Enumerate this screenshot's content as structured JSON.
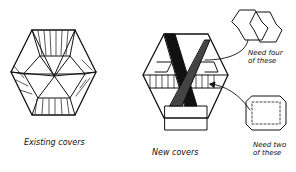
{
  "diagram": {
    "style": "hand-drawn sketch",
    "colors": {
      "ink": "#111111",
      "background": "#ffffff"
    },
    "figures": [
      {
        "id": "existing",
        "label": "Existing covers",
        "shape": "hexagonal tray with radial cover struts"
      },
      {
        "id": "new",
        "label": "New covers",
        "shape": "hexagonal tray with X-shaped dark panels and striped center band"
      }
    ],
    "callouts": [
      {
        "id": "four",
        "line1": "Need four",
        "line2": "of these",
        "shape": "pair of hexagonal cover pieces"
      },
      {
        "id": "two",
        "line1": "Need two",
        "line2": "of these",
        "shape": "square cover with dashed fold lines"
      }
    ]
  }
}
